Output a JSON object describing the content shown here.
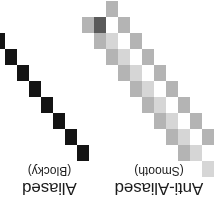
{
  "figure": {
    "rotation_degrees": 180,
    "background_color": "#ffffff",
    "width": 219,
    "height": 224
  },
  "panels": [
    {
      "id": "anti-aliased",
      "title": "Anti-Aliased",
      "subtitle": "(Smooth)",
      "core_color": "#5a5a5a",
      "edge_color": "#b4b4b4",
      "faint_color": "#d6d6d6",
      "steps": 9,
      "block_width": 12,
      "block_height": 16,
      "origin_x": 17,
      "origin_y": 63
    },
    {
      "id": "aliased",
      "title": "Aliased",
      "subtitle": "(Blocky)",
      "core_color": "#141414",
      "edge_color": "#ffffff",
      "faint_color": "#ffffff",
      "steps": 9,
      "block_width": 12,
      "block_height": 16,
      "origin_x": 10,
      "origin_y": 63
    }
  ]
}
